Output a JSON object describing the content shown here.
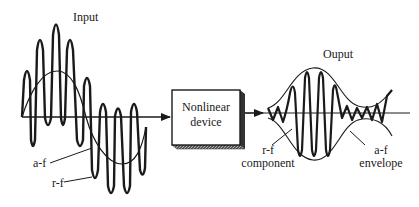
{
  "diagram": {
    "input_label": "Input",
    "output_label": "Ouput",
    "device": {
      "line1": "Nonlinear",
      "line2": "device"
    },
    "input_annotations": {
      "af": "a-f",
      "rf": "r-f"
    },
    "output_annotations": {
      "rf_line1": "r-f",
      "rf_line2": "component",
      "af_line1": "a-f",
      "af_line2": "envelope"
    },
    "colors": {
      "stroke": "#1a1a1a",
      "background": "#ffffff",
      "box_shade": "#3a3a3a"
    }
  }
}
